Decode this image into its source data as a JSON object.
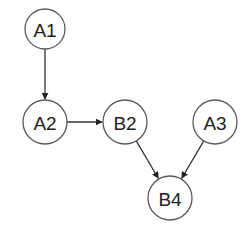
{
  "diagram": {
    "type": "directed-graph",
    "colors": {
      "background": "#ffffff",
      "node_stroke": "#5a5a5a",
      "node_fill": "#ffffff",
      "edge": "#333333",
      "label": "#222222"
    },
    "nodes": [
      {
        "id": "A1",
        "label": "A1",
        "cx": 45,
        "cy": 29,
        "r": 20
      },
      {
        "id": "A2",
        "label": "A2",
        "cx": 45,
        "cy": 122,
        "r": 22
      },
      {
        "id": "B2",
        "label": "B2",
        "cx": 125,
        "cy": 122,
        "r": 22
      },
      {
        "id": "A3",
        "label": "A3",
        "cx": 215,
        "cy": 122,
        "r": 22
      },
      {
        "id": "B4",
        "label": "B4",
        "cx": 170,
        "cy": 198,
        "r": 22
      }
    ],
    "edges": [
      {
        "from": "A1",
        "to": "A2"
      },
      {
        "from": "A2",
        "to": "B2"
      },
      {
        "from": "B2",
        "to": "B4"
      },
      {
        "from": "A3",
        "to": "B4"
      }
    ]
  }
}
